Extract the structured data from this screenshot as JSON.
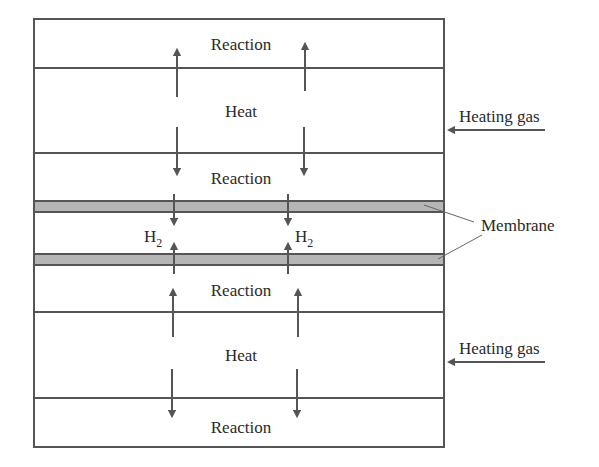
{
  "diagram": {
    "layers": [
      {
        "name": "reaction",
        "label": "Reaction"
      },
      {
        "name": "heat",
        "label": "Heat"
      },
      {
        "name": "reaction",
        "label": "Reaction"
      },
      {
        "name": "membrane",
        "label": ""
      },
      {
        "name": "hydrogen",
        "label": "H",
        "subscript": "2"
      },
      {
        "name": "membrane",
        "label": ""
      },
      {
        "name": "reaction",
        "label": "Reaction"
      },
      {
        "name": "heat",
        "label": "Heat"
      },
      {
        "name": "reaction",
        "label": "Reaction"
      }
    ],
    "labels": {
      "reaction_top": "Reaction",
      "heat_top": "Heat",
      "reaction_upper": "Reaction",
      "h2_left": "H",
      "h2_right": "H",
      "h2_sub": "2",
      "reaction_lower": "Reaction",
      "heat_bottom": "Heat",
      "reaction_bottom": "Reaction",
      "heating_gas_top": "Heating gas",
      "heating_gas_bottom": "Heating gas",
      "membrane": "Membrane"
    },
    "colors": {
      "line": "#555555",
      "membrane_fill": "#b5b5b5",
      "text": "#2a2a2a"
    }
  }
}
